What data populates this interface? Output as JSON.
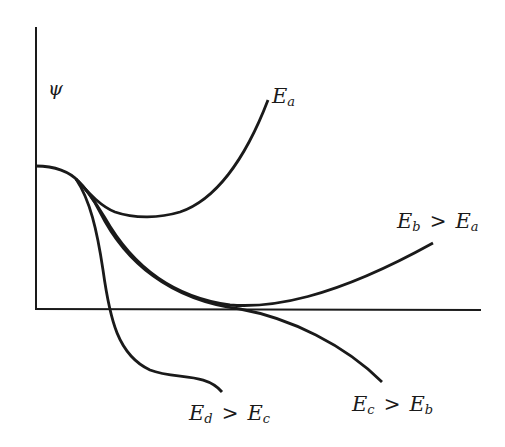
{
  "diagram": {
    "y_axis_label": "ψ",
    "curves": [
      {
        "id": "Ea",
        "label_main": "E",
        "label_sub": "a",
        "relation": "",
        "label_rhs_main": "",
        "label_rhs_sub": ""
      },
      {
        "id": "Eb",
        "label_main": "E",
        "label_sub": "b",
        "relation": ">",
        "label_rhs_main": "E",
        "label_rhs_sub": "a"
      },
      {
        "id": "Ec",
        "label_main": "E",
        "label_sub": "c",
        "relation": ">",
        "label_rhs_main": "E",
        "label_rhs_sub": "b"
      },
      {
        "id": "Ed",
        "label_main": "E",
        "label_sub": "d",
        "relation": ">",
        "label_rhs_main": "E",
        "label_rhs_sub": "c"
      }
    ],
    "colors": {
      "line": "#1a1a1a",
      "background": "#ffffff"
    }
  }
}
